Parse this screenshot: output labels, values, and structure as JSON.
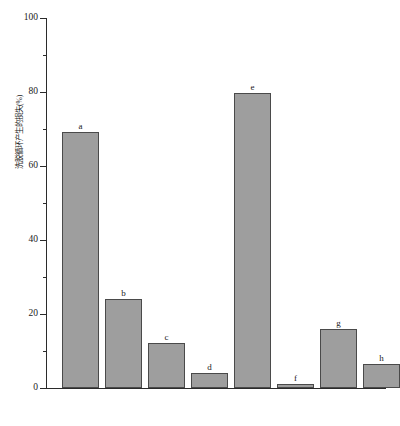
{
  "chart_data": {
    "type": "bar",
    "title": "",
    "xlabel": "",
    "ylabel": "洗脱循环产生的损失(%)",
    "categories": [
      "a",
      "b",
      "c",
      "d",
      "e",
      "f",
      "g",
      "h"
    ],
    "values": [
      69,
      24,
      12,
      4,
      79.5,
      1,
      16,
      6.5
    ],
    "point_labels": [
      "a",
      "b",
      "c",
      "d",
      "e",
      "f",
      "g",
      "h"
    ],
    "ylim": [
      0,
      100
    ],
    "ytick_major": [
      0,
      20,
      40,
      60,
      80,
      100
    ],
    "ytick_minor": [
      10,
      30,
      50,
      70,
      90
    ],
    "ytick_labels": [
      "0",
      "20",
      "40",
      "60",
      "80",
      "100"
    ],
    "grid": false,
    "legend": null,
    "legend_position": "none",
    "bar_fill_color": "#9e9e9e",
    "bar_edge_color": "#4a4a4a",
    "axis_color": "#2b2b2b"
  }
}
